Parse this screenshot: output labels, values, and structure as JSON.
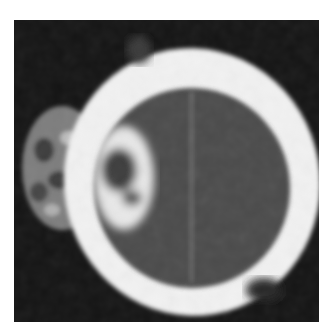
{
  "image": {
    "description": "Axial CT scan of a head showing a thick bright skull ring, dark brain tissue inside, and a mottled mass protruding on the left side",
    "colors": {
      "background": "#ffffff",
      "frame": "#141414",
      "bone": "#f2f2f2",
      "brain": "#4a4a4a",
      "mass": "#8a8a8a"
    }
  }
}
